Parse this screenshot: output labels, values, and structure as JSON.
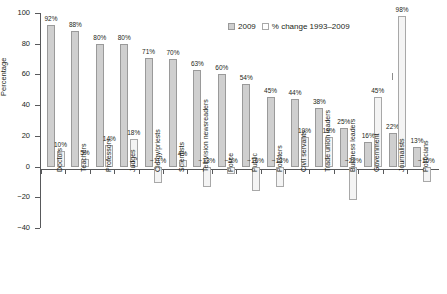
{
  "chart_data": {
    "type": "bar",
    "title": "",
    "xlabel": "",
    "ylabel": "Percentage",
    "ylim": [
      -40,
      100
    ],
    "yticks": [
      100,
      80,
      60,
      40,
      20,
      0,
      -20,
      -40
    ],
    "ytick_labels": [
      "100",
      "80",
      "60",
      "40",
      "20",
      "0",
      "−20",
      "−40"
    ],
    "grid": false,
    "legend_position": "top-center",
    "categories": [
      "Doctors",
      "Teachers",
      "Professors",
      "Judges",
      "Clergy/priests",
      "Scientists",
      "Television newsreaders",
      "Police",
      "Public",
      "Pollsters",
      "Civil servants",
      "Trade union leaders",
      "Business leaders",
      "Government",
      "Journalists",
      "Politicians"
    ],
    "series": [
      {
        "name": "2009",
        "values": [
          92,
          88,
          80,
          80,
          71,
          70,
          63,
          60,
          54,
          45,
          44,
          38,
          25,
          16,
          22,
          13
        ],
        "labels": [
          "92%",
          "88%",
          "80%",
          "80%",
          "71%",
          "70%",
          "63%",
          "60%",
          "54%",
          "45%",
          "44%",
          "38%",
          "25%",
          "16%",
          "22%",
          "13%"
        ],
        "color": "#cfcfcf"
      },
      {
        "name": "% change 1993–2009",
        "values": [
          10,
          5,
          14,
          18,
          -11,
          4,
          -13,
          -5,
          -16,
          -13,
          19,
          19,
          -22,
          45,
          98,
          -10
        ],
        "labels": [
          "10%",
          "5%",
          "14%",
          "18%",
          "−11%",
          "4%",
          "−13%",
          "−5%",
          "−16%",
          "−13%",
          "19%",
          "19%",
          "−22%",
          "45%",
          "98%",
          "−10%"
        ],
        "color": "#f4f4f4"
      }
    ]
  },
  "legend": {
    "items": [
      {
        "label": "2009",
        "swatch": "main"
      },
      {
        "label": "% change 1993–2009",
        "swatch": "chg"
      }
    ]
  }
}
